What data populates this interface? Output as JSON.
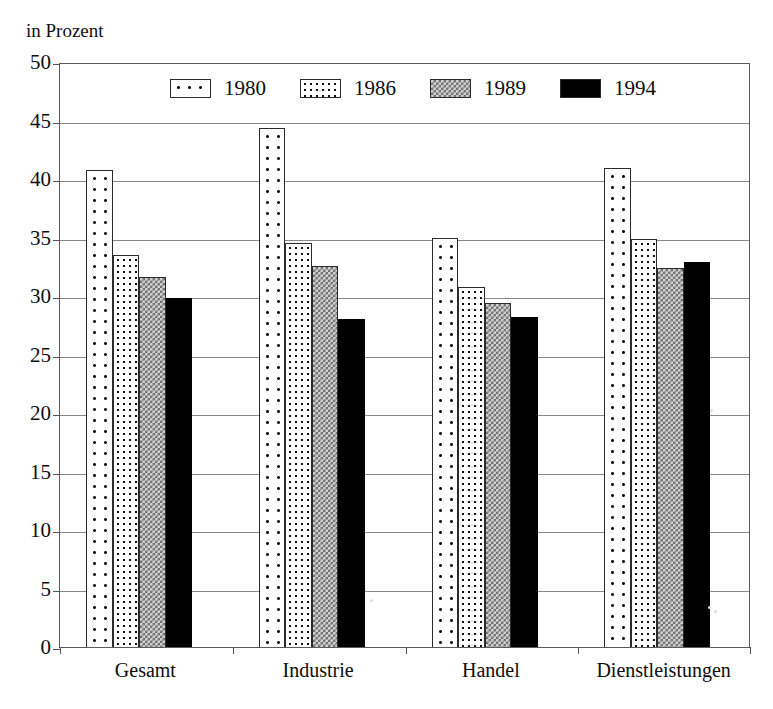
{
  "figure": {
    "title_partial": "...beschäftigung",
    "unit_label": "in Prozent"
  },
  "legend": {
    "position": "top-inside",
    "items": [
      {
        "label": "1980",
        "pattern": "sparse-dots",
        "color": "#ffffff"
      },
      {
        "label": "1986",
        "pattern": "dense-dots",
        "color": "#ffffff"
      },
      {
        "label": "1989",
        "pattern": "gray-checker",
        "color": "#9a9a9a"
      },
      {
        "label": "1994",
        "pattern": "solid",
        "color": "#000000"
      }
    ]
  },
  "axes": {
    "y_ticks": [
      "50",
      "45",
      "40",
      "35",
      "30",
      "25",
      "20",
      "15",
      "10",
      "5",
      "0"
    ],
    "y_min": 0,
    "y_max": 50,
    "y_step": 5,
    "grid": true,
    "x_categories": [
      "Gesamt",
      "Industrie",
      "Handel",
      "Dienstleistungen"
    ]
  },
  "chart_data": {
    "type": "bar",
    "title": "in Prozent",
    "xlabel": "",
    "ylabel": "in Prozent",
    "ylim": [
      0,
      50
    ],
    "ystep": 5,
    "grid": true,
    "legend_position": "top-inside",
    "categories": [
      "Gesamt",
      "Industrie",
      "Handel",
      "Dienstleistungen"
    ],
    "series": [
      {
        "name": "1980",
        "pattern": "sparse-dots",
        "values": [
          40.8,
          44.4,
          35.0,
          40.9
        ]
      },
      {
        "name": "1986",
        "pattern": "dense-dots",
        "values": [
          33.5,
          34.5,
          30.8,
          34.9
        ]
      },
      {
        "name": "1989",
        "pattern": "gray-checker",
        "values": [
          31.6,
          32.6,
          29.4,
          32.4
        ]
      },
      {
        "name": "1994",
        "pattern": "solid-black",
        "values": [
          29.8,
          28.0,
          28.2,
          32.9
        ]
      }
    ]
  }
}
